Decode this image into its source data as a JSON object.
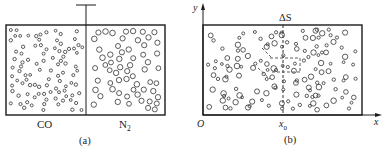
{
  "figure": {
    "panel_a": {
      "caption": "(a)",
      "left_gas": "CO",
      "right_gas_main": "N",
      "right_gas_sub": "2",
      "box": {
        "x": 6,
        "y": 25,
        "w": 159,
        "h": 90
      },
      "partition_x": 86,
      "left_molecule_size": "small",
      "right_molecule_size": "large"
    },
    "panel_b": {
      "caption": "(b)",
      "y_axis_label": "y",
      "x_axis_label": "x",
      "origin_label": "O",
      "x0_main": "x",
      "x0_sub": "0",
      "area_label": "ΔS",
      "box": {
        "x": 203,
        "y": 25,
        "w": 159,
        "h": 90
      },
      "dashed_x": 283
    },
    "colors": {
      "stroke": "#1a1a1a",
      "background": "#ffffff"
    }
  }
}
